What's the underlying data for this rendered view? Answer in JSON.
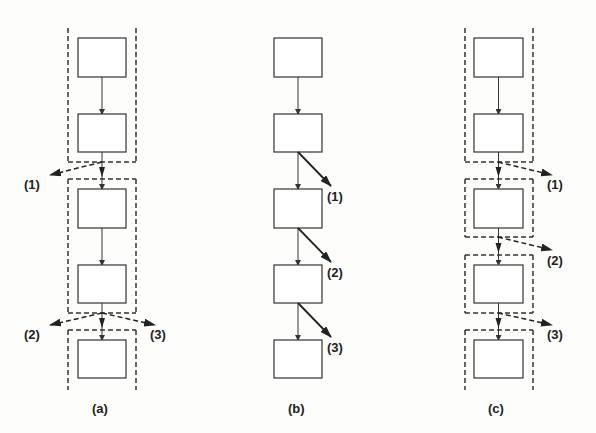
{
  "colors": {
    "stroke": "#333333",
    "background": "#fdfdfb"
  },
  "panels": [
    {
      "id": "a",
      "caption": "(a)",
      "boxes": [
        {
          "x": 78,
          "y": 38,
          "w": 48,
          "h": 39
        },
        {
          "x": 78,
          "y": 114,
          "w": 48,
          "h": 38
        },
        {
          "x": 78,
          "y": 189,
          "w": 48,
          "h": 39
        },
        {
          "x": 78,
          "y": 265,
          "w": 48,
          "h": 38
        },
        {
          "x": 78,
          "y": 340,
          "w": 48,
          "h": 38
        }
      ],
      "regions": [
        {
          "x": 68,
          "y": 28,
          "w": 68,
          "h": 134,
          "open_top": true
        },
        {
          "x": 68,
          "y": 179,
          "w": 68,
          "h": 134
        },
        {
          "x": 68,
          "y": 330,
          "w": 68,
          "h": 60,
          "open_bottom": true
        }
      ],
      "branches": [
        {
          "label": "(1)",
          "from": [
            102,
            162
          ],
          "to": [
            50,
            175
          ],
          "style": "dashed",
          "lx": 24,
          "ly": 178
        },
        {
          "label": "(2)",
          "from": [
            102,
            313
          ],
          "to": [
            50,
            325
          ],
          "style": "dashed",
          "lx": 24,
          "ly": 328
        },
        {
          "label": "(3)",
          "from": [
            102,
            313
          ],
          "to": [
            155,
            325
          ],
          "style": "dashed",
          "lx": 150,
          "ly": 328
        }
      ],
      "caption_pos": [
        92,
        402
      ]
    },
    {
      "id": "b",
      "caption": "(b)",
      "boxes": [
        {
          "x": 274,
          "y": 38,
          "w": 48,
          "h": 39
        },
        {
          "x": 274,
          "y": 114,
          "w": 48,
          "h": 38
        },
        {
          "x": 274,
          "y": 189,
          "w": 48,
          "h": 39
        },
        {
          "x": 274,
          "y": 265,
          "w": 48,
          "h": 38
        },
        {
          "x": 274,
          "y": 340,
          "w": 48,
          "h": 38
        }
      ],
      "regions": [],
      "branches": [
        {
          "label": "(1)",
          "from": [
            298,
            152
          ],
          "to": [
            331,
            186
          ],
          "style": "solid",
          "lx": 327,
          "ly": 190
        },
        {
          "label": "(2)",
          "from": [
            298,
            228
          ],
          "to": [
            331,
            262
          ],
          "style": "solid",
          "lx": 327,
          "ly": 266
        },
        {
          "label": "(3)",
          "from": [
            298,
            303
          ],
          "to": [
            331,
            337
          ],
          "style": "solid",
          "lx": 327,
          "ly": 341
        }
      ],
      "caption_pos": [
        288,
        402
      ]
    },
    {
      "id": "c",
      "caption": "(c)",
      "boxes": [
        {
          "x": 474,
          "y": 38,
          "w": 49,
          "h": 39
        },
        {
          "x": 474,
          "y": 114,
          "w": 49,
          "h": 38
        },
        {
          "x": 474,
          "y": 189,
          "w": 49,
          "h": 39
        },
        {
          "x": 474,
          "y": 265,
          "w": 49,
          "h": 38
        },
        {
          "x": 474,
          "y": 340,
          "w": 49,
          "h": 38
        }
      ],
      "regions": [
        {
          "x": 465,
          "y": 28,
          "w": 68,
          "h": 134,
          "open_top": true
        },
        {
          "x": 465,
          "y": 179,
          "w": 68,
          "h": 58
        },
        {
          "x": 465,
          "y": 255,
          "w": 68,
          "h": 58
        },
        {
          "x": 465,
          "y": 330,
          "w": 68,
          "h": 60,
          "open_bottom": true
        }
      ],
      "branches": [
        {
          "label": "(1)",
          "from": [
            498,
            162
          ],
          "to": [
            552,
            175
          ],
          "style": "dashed",
          "lx": 547,
          "ly": 178
        },
        {
          "label": "(2)",
          "from": [
            498,
            237
          ],
          "to": [
            552,
            250
          ],
          "style": "dashed",
          "lx": 547,
          "ly": 254
        },
        {
          "label": "(3)",
          "from": [
            498,
            313
          ],
          "to": [
            552,
            325
          ],
          "style": "dashed",
          "lx": 547,
          "ly": 328
        }
      ],
      "caption_pos": [
        488,
        402
      ]
    }
  ]
}
